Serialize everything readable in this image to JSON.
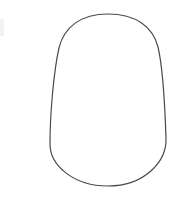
{
  "canvas": {
    "width": 190,
    "height": 201,
    "background_color": "#ffffff"
  },
  "artwork": {
    "title": "Egg-shaped outline contour",
    "description": "Single closed line-art contour: rounded narrow dome at top widening to a broad rounded base",
    "stroke_color": "#4a4a4a",
    "stroke_width": 1.2,
    "fill_color": "none",
    "bounds": {
      "left": 50,
      "top": 14,
      "right": 166,
      "bottom": 187,
      "width": 116,
      "height": 173
    },
    "anchors": {
      "top_apex_x": 108,
      "top_apex_y": 14,
      "bottom_apex_x": 108,
      "bottom_apex_y": 186,
      "left_widest_x": 50,
      "left_widest_y": 146,
      "right_widest_x": 166,
      "right_widest_y": 140
    },
    "path": "M 108 14 C 136 14 153 27 158 47 C 163 68 165 108 166 138 C 167 162 144 186 108 186 C 73 186 50 165 50 144 C 50 112 54 70 59 48 C 64 27 81 14 108 14 Z"
  },
  "artifacts": {
    "left_edge_smudge": {
      "color": "#f2f2f2",
      "x": 0,
      "y": 19,
      "width": 4,
      "height": 17
    }
  }
}
